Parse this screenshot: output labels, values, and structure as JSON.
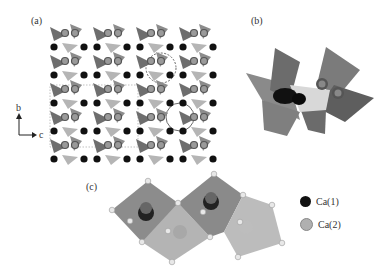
{
  "figure": {
    "panels": [
      {
        "id": "a",
        "label": "(a)",
        "description": "Crystal structure projection along a-axis showing tetrahedra and Ca atoms"
      },
      {
        "id": "b",
        "label": "(b)",
        "description": "Close-up of tetrahedral cluster with Ca atoms"
      },
      {
        "id": "c",
        "label": "(c)",
        "description": "Ca coordination polyhedra"
      }
    ],
    "axes": {
      "vertical": "b",
      "horizontal": "c"
    },
    "legend": [
      {
        "label": "Ca(1)",
        "color": "#111111"
      },
      {
        "label": "Ca(2)",
        "color": "#b0b0b0"
      }
    ]
  },
  "colors": {
    "tetra_dark": "#6e6e6e",
    "tetra_mid": "#8c8c8c",
    "tetra_light": "#b5b5b5",
    "ca1": "#111111",
    "ca2": "#7a7a7a",
    "oxygen": "#e0e0e0"
  }
}
